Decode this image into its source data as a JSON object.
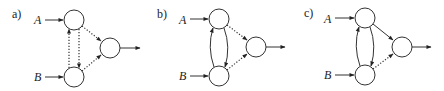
{
  "diagram": {
    "panels": [
      {
        "label": "a)",
        "inputs": [
          "A",
          "B"
        ],
        "edges": {
          "A_to_B": "dotted",
          "B_to_A": "dotted",
          "A_to_out": "dotted",
          "B_to_out": "dotted"
        }
      },
      {
        "label": "b)",
        "inputs": [
          "A",
          "B"
        ],
        "edges": {
          "A_to_B": "solid",
          "B_to_A": "solid",
          "A_to_out": "dotted",
          "B_to_out": "dotted"
        }
      },
      {
        "label": "c)",
        "inputs": [
          "A",
          "B"
        ],
        "edges": {
          "A_to_B": "solid",
          "B_to_A": "solid",
          "A_to_out": "solid",
          "B_to_out": "dotted"
        }
      }
    ],
    "colors": {
      "stroke": "#333333",
      "background": "#ffffff"
    }
  }
}
